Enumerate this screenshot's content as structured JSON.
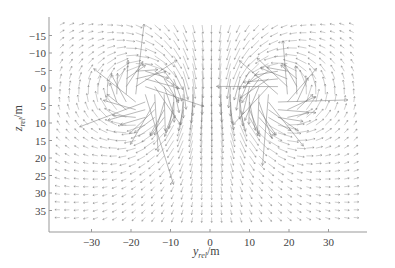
{
  "chart_data": {
    "type": "quiver",
    "title": "",
    "xlabel": "y_rel/m",
    "ylabel": "z_rel/m",
    "xlabel_main": "y",
    "xlabel_sub": "rel",
    "xlabel_unit": "/m",
    "ylabel_main": "z",
    "ylabel_sub": "rel",
    "ylabel_unit": "/m",
    "xlim": [
      -40,
      40
    ],
    "ylim": [
      40,
      -20
    ],
    "y_axis_inverted": true,
    "xticks": [
      -30,
      -20,
      -10,
      0,
      10,
      20,
      30
    ],
    "yticks": [
      -15,
      -10,
      -5,
      0,
      5,
      10,
      15,
      20,
      25,
      30,
      35
    ],
    "grid": false,
    "vortices": [
      {
        "name": "left vortex",
        "center_y": -17,
        "center_z": 2,
        "rotation": "counterclockwise-in-plot"
      },
      {
        "name": "right vortex",
        "center_y": 17,
        "center_z": 2,
        "rotation": "clockwise-in-plot"
      }
    ],
    "arrow_color": "#777777"
  }
}
